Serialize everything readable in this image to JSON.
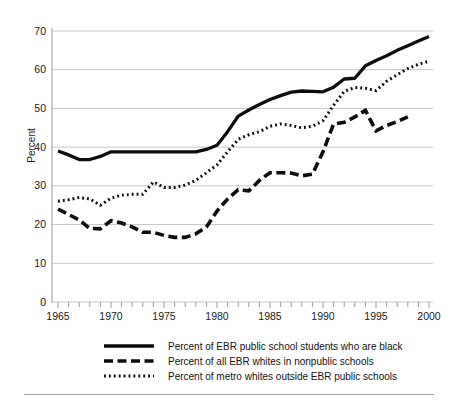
{
  "chart_data": {
    "type": "line",
    "title": "",
    "xlabel": "",
    "ylabel": "Percent",
    "xlim": [
      1964.4,
      2000.6
    ],
    "ylim": [
      0,
      70
    ],
    "y_ticks": [
      0,
      10,
      20,
      30,
      40,
      50,
      60,
      70
    ],
    "x_ticks_labeled": [
      1965,
      1970,
      1975,
      1980,
      1985,
      1990,
      1995,
      2000
    ],
    "x_tick_step_minor": 1,
    "grid": "horizontal",
    "legend_position": "below-plot",
    "x": [
      1965,
      1966,
      1967,
      1968,
      1969,
      1970,
      1971,
      1972,
      1973,
      1974,
      1975,
      1976,
      1977,
      1978,
      1979,
      1980,
      1981,
      1982,
      1983,
      1984,
      1985,
      1986,
      1987,
      1988,
      1989,
      1990,
      1991,
      1992,
      1993,
      1994,
      1995,
      1996,
      1997,
      1998,
      1999,
      2000
    ],
    "series": [
      {
        "name": "Percent of EBR public school students who are black",
        "style": "solid",
        "color": "#0d0d0d",
        "values": [
          39.0,
          38.0,
          36.8,
          36.8,
          37.6,
          38.8,
          38.8,
          38.8,
          38.8,
          38.8,
          38.8,
          38.8,
          38.8,
          38.8,
          39.4,
          40.5,
          44.0,
          48.0,
          49.6,
          51.0,
          52.3,
          53.3,
          54.2,
          54.5,
          54.4,
          54.3,
          55.5,
          57.6,
          57.8,
          61.0,
          62.4,
          63.6,
          65.0,
          66.2,
          67.4,
          68.6
        ]
      },
      {
        "name": "Percent of all EBR whites in nonpublic schools",
        "style": "dashed",
        "color": "#0d0d0d",
        "values": [
          24.0,
          22.6,
          21.2,
          19.0,
          18.9,
          21.0,
          20.4,
          19.4,
          18.0,
          18.0,
          17.2,
          16.7,
          16.7,
          17.6,
          19.4,
          23.5,
          26.6,
          29.0,
          28.7,
          31.4,
          33.4,
          33.4,
          33.3,
          32.6,
          33.0,
          38.8,
          46.0,
          46.4,
          47.8,
          49.5,
          44.2,
          45.6,
          46.6,
          47.8,
          null,
          null
        ]
      },
      {
        "name": "Percent of metro whites outside EBR public schools",
        "style": "dotted",
        "color": "#0d0d0d",
        "values": [
          26.0,
          26.4,
          27.0,
          26.6,
          25.0,
          26.8,
          27.6,
          27.8,
          27.8,
          31.0,
          29.6,
          29.6,
          30.2,
          31.4,
          33.4,
          35.4,
          38.8,
          42.0,
          43.2,
          44.0,
          45.4,
          46.0,
          45.6,
          45.0,
          45.4,
          46.8,
          50.8,
          54.4,
          55.4,
          55.2,
          54.6,
          57.0,
          58.7,
          60.3,
          61.4,
          62.2
        ]
      }
    ]
  },
  "axis": {
    "y_title": "Percent"
  },
  "legend": {
    "items": [
      {
        "label": "Percent of EBR public school students who are black",
        "style": "solid"
      },
      {
        "label": "Percent of all EBR whites in nonpublic schools",
        "style": "dashed"
      },
      {
        "label": "Percent of metro whites outside EBR public schools",
        "style": "dotted"
      }
    ]
  }
}
